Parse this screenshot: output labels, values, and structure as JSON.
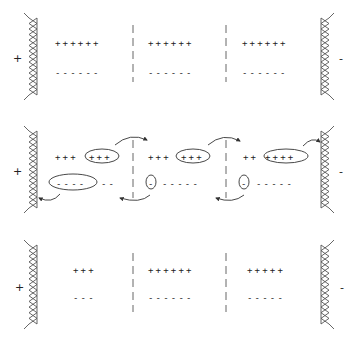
{
  "diagram": {
    "type": "electrode-domain-charge-transfer",
    "colors": {
      "stroke": "#555555",
      "text": "#222222",
      "background": "#ffffff"
    },
    "electrode_labels": {
      "left": "+",
      "right": "-"
    },
    "panels": [
      {
        "id": "initial",
        "segments": [
          {
            "plus": "++++++",
            "minus": "------"
          },
          {
            "plus": "++++++",
            "minus": "------"
          },
          {
            "plus": "++++++",
            "minus": "------"
          }
        ]
      },
      {
        "id": "transfer",
        "segments": [
          {
            "plus": "+++",
            "plus_grouped": "+++",
            "minus_grouped": "----",
            "minus": "--"
          },
          {
            "plus": "+++",
            "plus_grouped": "+++",
            "minus_grouped": "-",
            "minus": "-----"
          },
          {
            "plus": "++",
            "plus_grouped": "++++",
            "minus_grouped": "-",
            "minus": "-----"
          }
        ],
        "arrows": [
          {
            "from": "segment-1-plus-group",
            "to": "segment-2",
            "direction": "right"
          },
          {
            "from": "segment-2-plus-group",
            "to": "segment-3",
            "direction": "right"
          },
          {
            "from": "segment-3-plus-group",
            "to": "right-electrode",
            "direction": "right"
          },
          {
            "from": "segment-1-minus-group",
            "to": "left-electrode",
            "direction": "left"
          },
          {
            "from": "segment-2-minus-group",
            "to": "segment-1",
            "direction": "left"
          },
          {
            "from": "segment-3-minus-group",
            "to": "segment-2",
            "direction": "left"
          }
        ]
      },
      {
        "id": "final",
        "segments": [
          {
            "plus": "+++",
            "minus": "---"
          },
          {
            "plus": "++++++",
            "minus": "------"
          },
          {
            "plus": "+++++",
            "minus": "-----"
          }
        ]
      }
    ]
  }
}
